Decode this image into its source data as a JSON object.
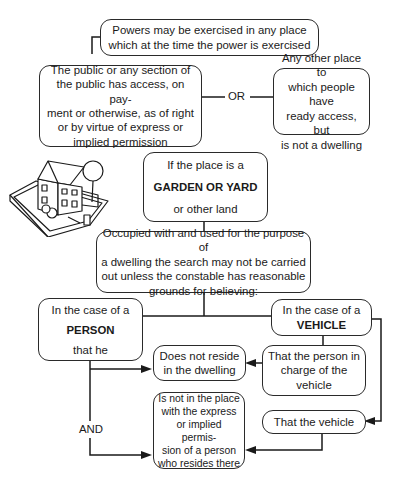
{
  "diagram": {
    "top_box": {
      "lines": [
        "Powers may be exercised in any place",
        "which at the time the power is exercised"
      ]
    },
    "public_box": {
      "lines": [
        "The public or any section of",
        "the public has access, on pay-",
        "ment or otherwise, as of right",
        "or by virtue of express or",
        "implied permission"
      ]
    },
    "or_label": "OR",
    "other_place_box": {
      "lines": [
        "Any other place to",
        "which people have",
        "ready access, but",
        "is not a dwelling"
      ]
    },
    "garden_box": {
      "line1": "If the place is a",
      "emphasis": "GARDEN OR YARD",
      "line3": "or other land"
    },
    "occupied_box": {
      "lines": [
        "Occupied with and used for the purpose of",
        "a dwelling the search may not be carried",
        "out unless the constable has reasonable",
        "grounds for believing:"
      ]
    },
    "person_box": {
      "line1": "In the case of a",
      "emphasis": "PERSON",
      "line3": "that he"
    },
    "vehicle_box": {
      "line1": "In the case of a",
      "emphasis": "VEHICLE"
    },
    "not_reside_box": {
      "lines": [
        "Does not reside",
        "in the dwelling"
      ]
    },
    "person_in_charge_box": {
      "lines": [
        "That the person in",
        "charge of the",
        "vehicle"
      ]
    },
    "and_label": "AND",
    "not_in_place_box": {
      "lines": [
        "Is not in the place",
        "with the express",
        "or implied permis-",
        "sion of a person",
        "who resides there"
      ]
    },
    "that_vehicle_box": {
      "lines": [
        "That the vehicle"
      ]
    },
    "illustration": "house-with-garden-illustration"
  }
}
